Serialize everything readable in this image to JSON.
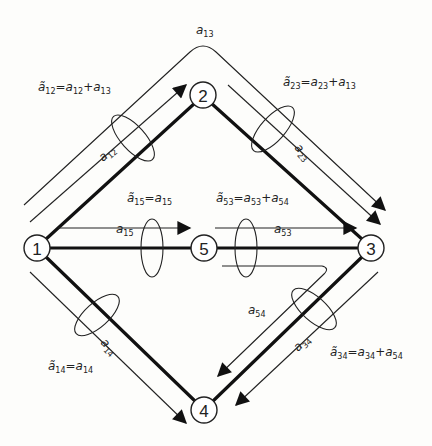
{
  "diagram": {
    "nodes": [
      {
        "id": "1",
        "label": "1",
        "x": 37,
        "y": 248
      },
      {
        "id": "2",
        "label": "2",
        "x": 203,
        "y": 95
      },
      {
        "id": "3",
        "label": "3",
        "x": 371,
        "y": 248
      },
      {
        "id": "4",
        "label": "4",
        "x": 204,
        "y": 410
      },
      {
        "id": "5",
        "label": "5",
        "x": 204,
        "y": 248
      }
    ],
    "edges": [
      {
        "from": "1",
        "to": "2"
      },
      {
        "from": "2",
        "to": "3"
      },
      {
        "from": "1",
        "to": "5"
      },
      {
        "from": "5",
        "to": "3"
      },
      {
        "from": "1",
        "to": "4"
      },
      {
        "from": "3",
        "to": "4"
      }
    ],
    "flows": {
      "a13": {
        "name": "a",
        "sub": "13"
      },
      "a12": {
        "name": "a",
        "sub": "12"
      },
      "a23": {
        "name": "a",
        "sub": "23"
      },
      "a15": {
        "name": "a",
        "sub": "15"
      },
      "a53": {
        "name": "a",
        "sub": "53"
      },
      "a54": {
        "name": "a",
        "sub": "54"
      },
      "a14": {
        "name": "a",
        "sub": "14"
      },
      "a34": {
        "name": "a",
        "sub": "34"
      }
    },
    "aggregates": {
      "e12": {
        "lhs": "ã",
        "lhs_sub": "12",
        "eq": "=",
        "t1": "a",
        "t1_sub": "12",
        "plus": "+",
        "t2": "a",
        "t2_sub": "13"
      },
      "e23": {
        "lhs": "ã",
        "lhs_sub": "23",
        "eq": "=",
        "t1": "a",
        "t1_sub": "23",
        "plus": "+",
        "t2": "a",
        "t2_sub": "13"
      },
      "e15": {
        "lhs": "ã",
        "lhs_sub": "15",
        "eq": "=",
        "t1": "a",
        "t1_sub": "15"
      },
      "e53": {
        "lhs": "ã",
        "lhs_sub": "53",
        "eq": "=",
        "t1": "a",
        "t1_sub": "53",
        "plus": "+",
        "t2": "a",
        "t2_sub": "54"
      },
      "e14": {
        "lhs": "ã",
        "lhs_sub": "14",
        "eq": "=",
        "t1": "a",
        "t1_sub": "14"
      },
      "e34": {
        "lhs": "ã",
        "lhs_sub": "34",
        "eq": "=",
        "t1": "a",
        "t1_sub": "34",
        "plus": "+",
        "t2": "a",
        "t2_sub": "54"
      }
    }
  }
}
